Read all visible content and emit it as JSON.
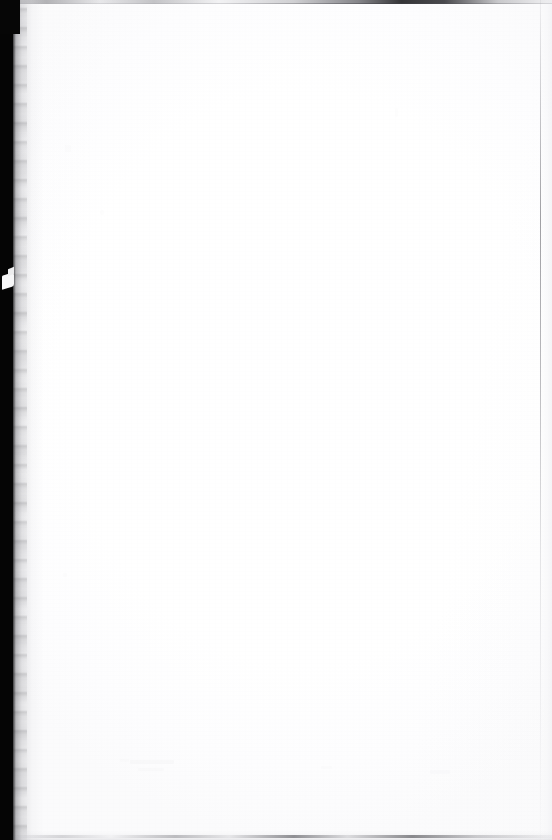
{
  "document": {
    "page_type": "blank-scanned-page",
    "visible_text": "",
    "width": 552,
    "height": 840
  },
  "colors": {
    "paper": "#ffffff",
    "gutter_black": "#050505",
    "gutter_shadow": "#5a5a60",
    "edge_line": "#787880",
    "right_hairline": "#78787e",
    "page_tone": "#fdfdfe"
  },
  "artifacts": {
    "left_gutter": {
      "name": "scanner-gutter-shadow",
      "edge": "left",
      "width_px": 13
    },
    "top_edge": {
      "name": "top-scan-edge-line",
      "edge": "top",
      "height_px": 4
    },
    "bottom_edge": {
      "name": "bottom-scan-edge-line",
      "edge": "bottom",
      "height_px": 3
    },
    "right_hairline": {
      "name": "right-hairline",
      "edge": "right",
      "width_px": 1
    },
    "gutter_notch": {
      "name": "gutter-notch",
      "x_px": 2,
      "y_px": 274
    }
  }
}
